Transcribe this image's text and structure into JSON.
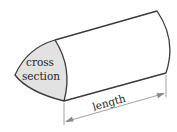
{
  "diagram": {
    "labels": {
      "cross_section_line1": "cross",
      "cross_section_line2": "section",
      "length": "length"
    },
    "colors": {
      "outline": "#3a3a3a",
      "cross_section_fill": "#e2e2e2",
      "dimension_line": "#8a8a8a",
      "text": "#222222",
      "background": "#ffffff"
    }
  }
}
